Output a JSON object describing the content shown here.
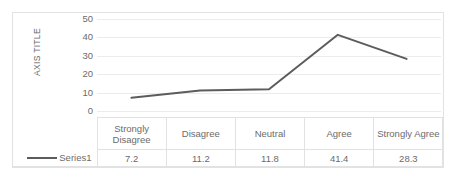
{
  "chart_data": {
    "type": "line",
    "title": "",
    "subtitle": "",
    "xlabel": "",
    "ylabel": "AXIS TITLE",
    "categories": [
      "Strongly Disagree",
      "Disagree",
      "Neutral",
      "Agree",
      "Strongly Agree"
    ],
    "series": [
      {
        "name": "Series1",
        "values": [
          7.2,
          11.2,
          11.8,
          41.4,
          28.3
        ],
        "color": "#5c5c5c"
      }
    ],
    "ylim": [
      0,
      50
    ],
    "y_ticks": [
      50,
      40,
      30,
      20,
      10,
      0
    ],
    "grid": true,
    "grid_axis": "y",
    "legend_position": "data-table-row",
    "show_data_table": true,
    "markers": false
  },
  "axes": {
    "y_title": "AXIS TITLE",
    "y_tick_labels": [
      "50",
      "40",
      "30",
      "20",
      "10",
      "0"
    ]
  },
  "table": {
    "category_row": [
      "Strongly Disagree",
      "Disagree",
      "Neutral",
      "Agree",
      "Strongly Agree"
    ],
    "series_label": "Series1",
    "value_row": [
      "7.2",
      "11.2",
      "11.8",
      "41.4",
      "28.3"
    ]
  },
  "colors": {
    "series_line": "#5c5c5c",
    "gridline": "#ececec",
    "border": "#e2e2e2",
    "text": "#6b6b6b",
    "background": "#ffffff"
  }
}
